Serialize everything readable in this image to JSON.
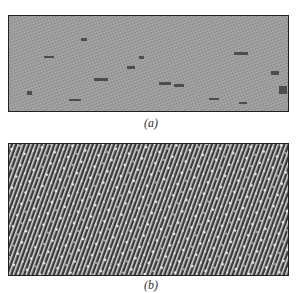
{
  "figure": {
    "panels": [
      {
        "id": "a",
        "caption": "(a)",
        "description": "Grayscale micrograph with fine diagonal lattice texture and scattered dark defects",
        "tone": "medium-gray"
      },
      {
        "id": "b",
        "caption": "(b)",
        "description": "High-contrast micrograph showing dense diagonal lattice fringes with bright spots",
        "tone": "dark-striped"
      }
    ]
  }
}
